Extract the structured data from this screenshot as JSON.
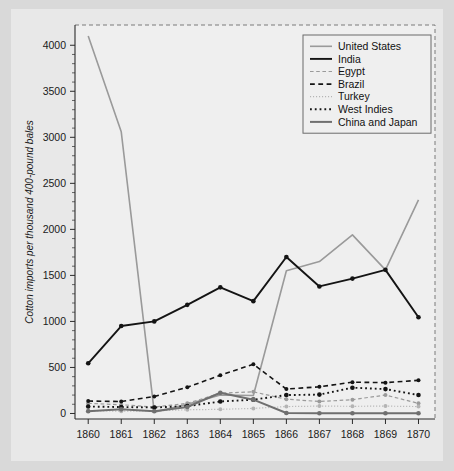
{
  "figure": {
    "background": "#d9d9d9",
    "panel_background": "#efefef"
  },
  "chart_data": {
    "type": "line",
    "title": "",
    "xlabel": "",
    "ylabel": "Cotton imports per thousand 400-pound bales",
    "x": [
      1860,
      1861,
      1862,
      1863,
      1864,
      1865,
      1866,
      1867,
      1868,
      1869,
      1870
    ],
    "xtick_labels": [
      "1860",
      "1861",
      "1862",
      "1863",
      "1864",
      "1865",
      "1866",
      "1867",
      "1868",
      "1869",
      "1870"
    ],
    "ytick_labels": [
      "0",
      "500",
      "1000",
      "1500",
      "2000",
      "2500",
      "3000",
      "3500",
      "4000"
    ],
    "yticks": [
      0,
      500,
      1000,
      1500,
      2000,
      2500,
      3000,
      3500,
      4000
    ],
    "ylim": [
      -60,
      4220
    ],
    "xlim": [
      1859.6,
      1870.5
    ],
    "grid": false,
    "minor_ticks": true,
    "legend_position": "top-right",
    "series": [
      {
        "name": "United States",
        "color": "#9a9a9a",
        "dash": "none",
        "width": 1.6,
        "marker": "none",
        "values": [
          4100,
          3060,
          15,
          100,
          200,
          195,
          1550,
          1650,
          1940,
          1560,
          2320
        ]
      },
      {
        "name": "India",
        "color": "#141414",
        "dash": "none",
        "width": 1.9,
        "marker": "circle",
        "values": [
          545,
          950,
          1000,
          1180,
          1370,
          1220,
          1700,
          1380,
          1465,
          1560,
          1045
        ]
      },
      {
        "name": "Egypt",
        "color": "#9a9a9a",
        "dash": "dashed",
        "width": 1.2,
        "marker": "circle",
        "values": [
          110,
          95,
          70,
          110,
          220,
          235,
          155,
          130,
          150,
          200,
          110
        ]
      },
      {
        "name": "Brazil",
        "color": "#141414",
        "dash": "dashed",
        "width": 1.6,
        "marker": "circle",
        "values": [
          135,
          130,
          185,
          285,
          415,
          535,
          265,
          290,
          340,
          335,
          360
        ]
      },
      {
        "name": "Turkey",
        "color": "#b4b4b4",
        "dash": "dotted",
        "width": 1.2,
        "marker": "circle",
        "values": [
          30,
          25,
          28,
          40,
          45,
          55,
          75,
          80,
          78,
          80,
          75
        ]
      },
      {
        "name": "West Indies",
        "color": "#141414",
        "dash": "dotted",
        "width": 1.9,
        "marker": "circle",
        "values": [
          75,
          70,
          65,
          80,
          130,
          150,
          200,
          205,
          280,
          265,
          200
        ]
      },
      {
        "name": "China and Japan",
        "color": "#6f6f6f",
        "dash": "none",
        "width": 2.0,
        "marker": "circle",
        "values": [
          25,
          45,
          25,
          70,
          225,
          150,
          5,
          3,
          2,
          2,
          2
        ]
      }
    ]
  }
}
